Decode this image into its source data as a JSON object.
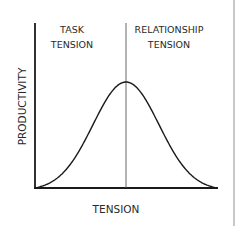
{
  "diagram": {
    "type": "bell-curve",
    "x_axis_label": "TENSION",
    "y_axis_label": "PRODUCTIVITY",
    "regions": [
      {
        "line1": "TASK",
        "line2": "TENSION"
      },
      {
        "line1": "RELATIONSHIP",
        "line2": "TENSION"
      }
    ],
    "divider_at": 0.5,
    "curve": {
      "shape": "gaussian",
      "peak_x": 0.5,
      "peak_y": 1.0
    }
  },
  "colors": {
    "axis": "#1a1a1a",
    "curve": "#1a1a1a",
    "divider": "#555555",
    "border": "#c8c8c8"
  }
}
